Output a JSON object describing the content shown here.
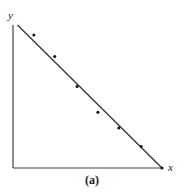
{
  "chart_data": {
    "type": "scatter",
    "title": "",
    "caption": "(a)",
    "xlabel": "x",
    "ylabel": "y",
    "grid": false,
    "legend": null,
    "xlim": [
      0,
      1
    ],
    "ylim": [
      0,
      1
    ],
    "points": [
      {
        "x": 0.14,
        "y": 0.93
      },
      {
        "x": 0.28,
        "y": 0.78
      },
      {
        "x": 0.43,
        "y": 0.57
      },
      {
        "x": 0.57,
        "y": 0.39
      },
      {
        "x": 0.71,
        "y": 0.28
      },
      {
        "x": 0.86,
        "y": 0.15
      },
      {
        "x": 1.0,
        "y": 0.0
      }
    ],
    "fit_line": {
      "x0": 0.03,
      "y0": 1.0,
      "x1": 1.0,
      "y1": 0.0
    },
    "annotations": [
      "Scatter points with a fitted straight line of negative slope"
    ]
  },
  "colors": {
    "axis": "#444444",
    "line": "#333333",
    "point": "#111111"
  }
}
